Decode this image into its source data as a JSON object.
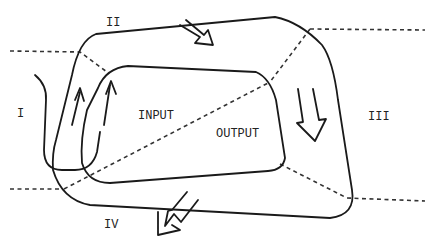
{
  "diagram": {
    "regions": [
      {
        "id": "I",
        "label": "I"
      },
      {
        "id": "II",
        "label": "II"
      },
      {
        "id": "III",
        "label": "III"
      },
      {
        "id": "IV",
        "label": "IV"
      }
    ],
    "inner_labels": {
      "input": "INPUT",
      "output": "OUTPUT"
    },
    "arrows": [
      {
        "name": "arrow-top",
        "direction": "down-right"
      },
      {
        "name": "arrow-right",
        "direction": "down"
      },
      {
        "name": "arrow-bottom",
        "direction": "down-left"
      },
      {
        "name": "arrow-left",
        "direction": "up"
      }
    ]
  }
}
